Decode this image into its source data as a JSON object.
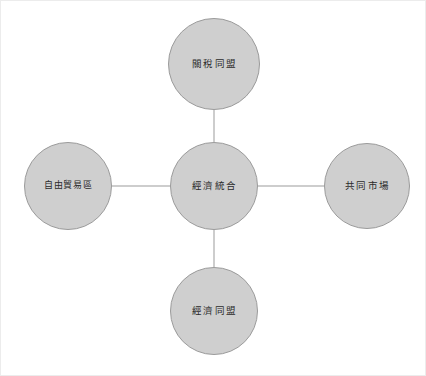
{
  "diagram": {
    "type": "hub-and-spoke",
    "title": "經濟統合",
    "background_color": "#ffffff",
    "node_fill_color": "#cfcfcf",
    "node_border_color": "#9b9b9b",
    "edge_color": "#9b9b9b",
    "label_color": "#2b2b2b",
    "frame_color": "#ececec",
    "nodes": [
      {
        "id": "center",
        "label": "經濟統合",
        "role": "hub",
        "cx": 214,
        "cy": 186,
        "diameter": 88
      },
      {
        "id": "top",
        "label": "關稅同盟",
        "role": "spoke",
        "cx": 214,
        "cy": 64,
        "diameter": 92
      },
      {
        "id": "left",
        "label": "自由貿易區",
        "role": "spoke",
        "cx": 68,
        "cy": 186,
        "diameter": 88
      },
      {
        "id": "right",
        "label": "共同市場",
        "role": "spoke",
        "cx": 367,
        "cy": 186,
        "diameter": 86
      },
      {
        "id": "bottom",
        "label": "經濟同盟",
        "role": "spoke",
        "cx": 214,
        "cy": 311,
        "diameter": 88
      }
    ],
    "edges": [
      {
        "id": "edge-center-top",
        "from": "center",
        "to": "top",
        "x1": 214,
        "y1": 142,
        "x2": 214,
        "y2": 110
      },
      {
        "id": "edge-center-left",
        "from": "center",
        "to": "left",
        "x1": 170,
        "y1": 186,
        "x2": 112,
        "y2": 186
      },
      {
        "id": "edge-center-right",
        "from": "center",
        "to": "right",
        "x1": 258,
        "y1": 186,
        "x2": 324,
        "y2": 186
      },
      {
        "id": "edge-center-bottom",
        "from": "center",
        "to": "bottom",
        "x1": 214,
        "y1": 230,
        "x2": 214,
        "y2": 267
      }
    ]
  }
}
